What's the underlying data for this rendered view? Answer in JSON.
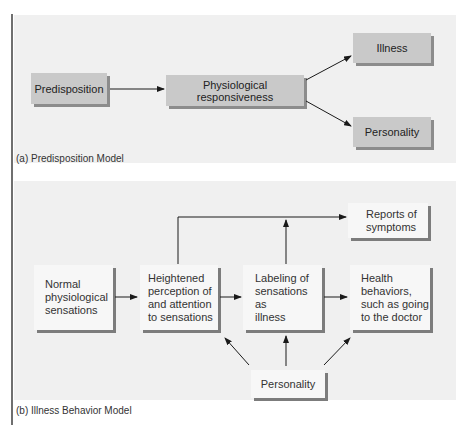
{
  "panel_a": {
    "caption": "(a) Predisposition Model",
    "nodes": {
      "predisposition": "Predisposition",
      "physiological_responsiveness": "Physiological responsiveness",
      "illness": "Illness",
      "personality": "Personality"
    },
    "edges": [
      [
        "Predisposition",
        "Physiological responsiveness"
      ],
      [
        "Physiological responsiveness",
        "Illness"
      ],
      [
        "Physiological responsiveness",
        "Personality"
      ]
    ]
  },
  "panel_b": {
    "caption": "(b) Illness Behavior Model",
    "nodes": {
      "normal": "Normal\nphysiological\nsensations",
      "heightened": "Heightened\nperception of\nand attention\nto sensations",
      "labeling": "Labeling of\nsensations as\nillness",
      "health": "Health\nbehaviors,\nsuch as going\nto the doctor",
      "reports": "Reports of\nsymptoms",
      "personality": "Personality"
    },
    "edges": [
      [
        "Normal physiological sensations",
        "Heightened perception of and attention to sensations"
      ],
      [
        "Heightened perception of and attention to sensations",
        "Labeling of sensations as illness"
      ],
      [
        "Labeling of sensations as illness",
        "Health behaviors, such as going to the doctor"
      ],
      [
        "Heightened perception of and attention to sensations",
        "Reports of symptoms"
      ],
      [
        "Labeling of sensations as illness",
        "Reports of symptoms"
      ],
      [
        "Personality",
        "Heightened perception of and attention to sensations"
      ],
      [
        "Personality",
        "Labeling of sensations as illness"
      ],
      [
        "Personality",
        "Health behaviors, such as going to the doctor"
      ]
    ]
  },
  "colors": {
    "panel_bg": "#f0f0f0",
    "gray_box": "#c9c9c9",
    "gray_box_shadow": "#8c8c8c",
    "white_box": "#f7f7f7",
    "white_box_shadow": "#7c7c7c",
    "arrow": "#1a1a1a"
  }
}
